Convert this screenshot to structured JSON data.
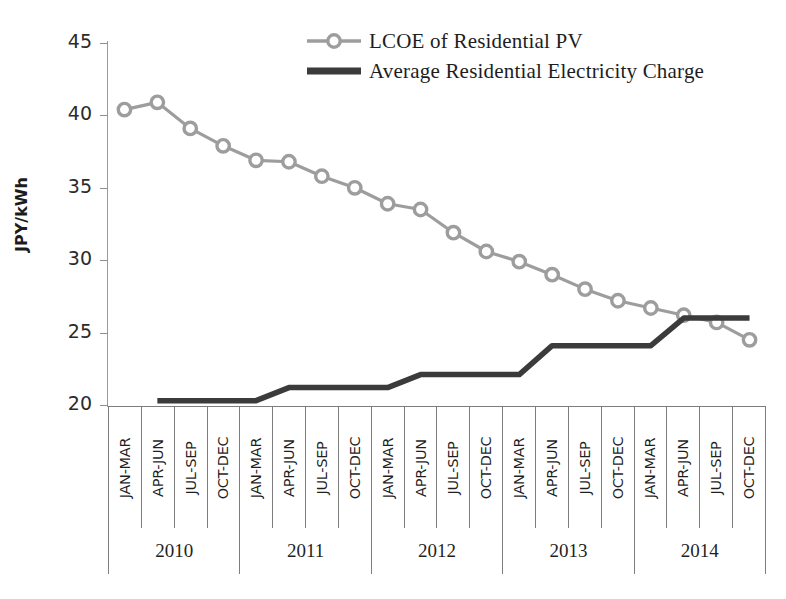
{
  "chart_data": {
    "type": "line",
    "title": "",
    "xlabel": "",
    "ylabel": "JPY/kWh",
    "ylim": [
      20,
      45
    ],
    "ytick_labels": [
      "45",
      "40",
      "35",
      "30",
      "25",
      "20"
    ],
    "ytick_values": [
      45,
      40,
      35,
      30,
      25,
      20
    ],
    "grid": false,
    "legend_position": "top-center",
    "categories": [
      "JAN-MAR",
      "APR-JUN",
      "JUL-SEP",
      "OCT-DEC",
      "JAN-MAR",
      "APR-JUN",
      "JUL-SEP",
      "OCT-DEC",
      "JAN-MAR",
      "APR-JUN",
      "JUL-SEP",
      "OCT-DEC",
      "JAN-MAR",
      "APR-JUN",
      "JUL-SEP",
      "OCT-DEC",
      "JAN-MAR",
      "APR-JUN",
      "JUL-SEP",
      "OCT-DEC"
    ],
    "year_groups": [
      {
        "label": "2010",
        "quarters": 4
      },
      {
        "label": "2011",
        "quarters": 4
      },
      {
        "label": "2012",
        "quarters": 4
      },
      {
        "label": "2013",
        "quarters": 4
      },
      {
        "label": "2014",
        "quarters": 4
      }
    ],
    "series": [
      {
        "name": "LCOE of Residential PV",
        "color": "#9d9d9d",
        "marker": "open-circle",
        "values": [
          40.4,
          40.9,
          39.1,
          37.9,
          36.9,
          36.8,
          35.8,
          35.0,
          33.9,
          33.5,
          31.9,
          30.6,
          29.9,
          29.0,
          28.0,
          27.2,
          26.7,
          26.2,
          25.7,
          24.5
        ]
      },
      {
        "name": "Average Residential Electricity Charge",
        "color": "#3b3b3b",
        "marker": "none",
        "values": [
          null,
          20.3,
          20.3,
          20.3,
          20.3,
          21.2,
          21.2,
          21.2,
          21.2,
          22.1,
          22.1,
          22.1,
          22.1,
          24.1,
          24.1,
          24.1,
          24.1,
          26.0,
          26.0,
          26.0
        ]
      }
    ]
  },
  "legend": {
    "items": [
      {
        "label": "LCOE of Residential PV",
        "style": "line-marker",
        "color": "#9d9d9d"
      },
      {
        "label": "Average Residential Electricity Charge",
        "style": "thick-line",
        "color": "#3b3b3b"
      }
    ]
  },
  "axis": {
    "y_title": "JPY/kWh"
  }
}
